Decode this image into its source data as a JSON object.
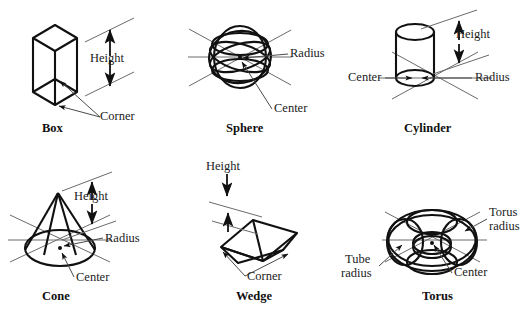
{
  "figure": {
    "stroke_color": "#111111",
    "leader_color": "#5a5a5a",
    "background": "#ffffff",
    "panels": [
      {
        "id": "box",
        "caption": "Box",
        "labels": [
          {
            "key": "height",
            "text": "Height"
          },
          {
            "key": "corner",
            "text": "Corner"
          }
        ]
      },
      {
        "id": "sphere",
        "caption": "Sphere",
        "labels": [
          {
            "key": "radius",
            "text": "Radius"
          },
          {
            "key": "center",
            "text": "Center"
          }
        ]
      },
      {
        "id": "cylinder",
        "caption": "Cylinder",
        "labels": [
          {
            "key": "height",
            "text": "Height"
          },
          {
            "key": "radius",
            "text": "Radius"
          },
          {
            "key": "center",
            "text": "Center"
          }
        ]
      },
      {
        "id": "cone",
        "caption": "Cone",
        "labels": [
          {
            "key": "height",
            "text": "Height"
          },
          {
            "key": "radius",
            "text": "Radius"
          },
          {
            "key": "center",
            "text": "Center"
          }
        ]
      },
      {
        "id": "wedge",
        "caption": "Wedge",
        "labels": [
          {
            "key": "height",
            "text": "Height"
          },
          {
            "key": "corner",
            "text": "Corner"
          }
        ]
      },
      {
        "id": "torus",
        "caption": "Torus",
        "labels": [
          {
            "key": "torus_radius_line1",
            "text": "Torus"
          },
          {
            "key": "torus_radius_line2",
            "text": "radius"
          },
          {
            "key": "tube_radius_line1",
            "text": "Tube"
          },
          {
            "key": "tube_radius_line2",
            "text": "radius"
          },
          {
            "key": "center",
            "text": "Center"
          }
        ]
      }
    ]
  }
}
